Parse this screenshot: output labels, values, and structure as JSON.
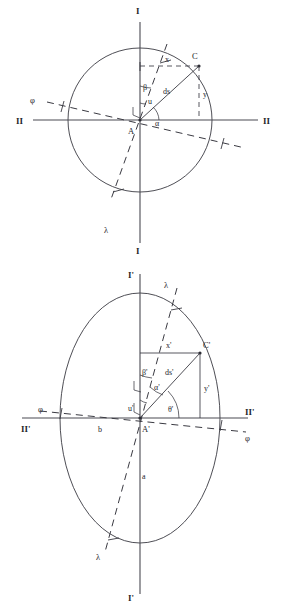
{
  "figure": {
    "background_color": "#ffffff",
    "stroke_color": "#3a3a42"
  },
  "upper": {
    "name": "circle-diagram",
    "shape": "circle",
    "axis_top_label": "I",
    "axis_bottom_label": "I",
    "axis_left_label": "II",
    "axis_right_label": "II",
    "center_label": "A",
    "point_label": "C",
    "radius_label": "ds",
    "horizontal_projection_label": "x",
    "vertical_projection_label": "y",
    "angle_beta": "β",
    "angle_u": "u",
    "angle_alpha": "α",
    "lambda_label_top": "λ",
    "lambda_label_bottom": "λ",
    "phi_label_left": "φ",
    "phi_label_right": "φ"
  },
  "lower": {
    "name": "ellipse-diagram",
    "shape": "ellipse",
    "axis_top_label": "I'",
    "axis_bottom_label": "I'",
    "axis_left_label": "II'",
    "axis_right_label": "II'",
    "center_label": "A'",
    "point_label": "C'",
    "radius_label": "ds'",
    "horizontal_projection_label": "x'",
    "vertical_projection_label": "y'",
    "angle_beta": "β'",
    "angle_u": "u'",
    "angle_alpha": "α'",
    "angle_theta": "θ'",
    "semi_axis_major_label": "a",
    "semi_axis_minor_label": "b",
    "lambda_label_top": "λ",
    "lambda_label_bottom": "λ",
    "phi_label_left": "φ",
    "phi_label_right": "φ"
  }
}
